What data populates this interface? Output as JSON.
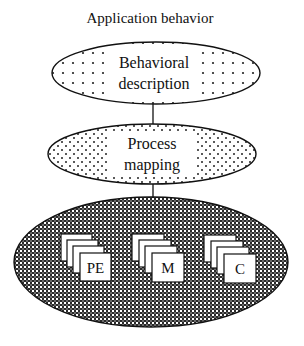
{
  "title": "Application behavior",
  "layers": [
    {
      "id": "behavioral-description",
      "line1": "Behavioral",
      "line2": "description",
      "fill": "dotted"
    },
    {
      "id": "process-mapping",
      "line1": "Process",
      "line2": "mapping",
      "fill": "dotted"
    },
    {
      "id": "architecture",
      "fill": "crosshatch",
      "components": [
        {
          "label": "PE"
        },
        {
          "label": "M"
        },
        {
          "label": "C"
        }
      ]
    }
  ],
  "colors": {
    "stroke": "#111111",
    "background": "#ffffff",
    "dots": "#222222",
    "hatch": "#2a2a2a"
  }
}
